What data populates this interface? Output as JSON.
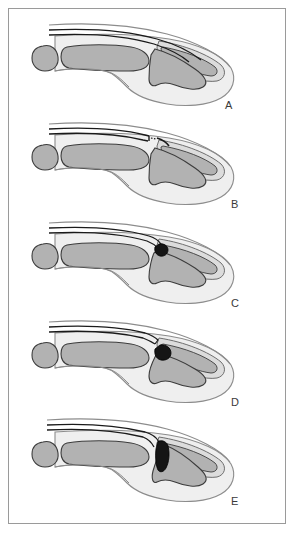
{
  "figure": {
    "panel_count": 5,
    "frame_color": "#9a9a9a",
    "background": "#ffffff"
  },
  "palette": {
    "bone_fill": "#b2b2b2",
    "bone_stroke": "#3c3c3c",
    "soft_tissue_fill": "#efefef",
    "soft_tissue_stroke": "#8c8c8c",
    "nail_fill": "#dcdcdc",
    "nail_stroke": "#6e6e6e",
    "tendon_stroke": "#1a1a1a",
    "fragment_fill": "#151515",
    "label_color": "#3a3a3a"
  },
  "panels": [
    {
      "id": "A",
      "label": "A",
      "label_x": 216,
      "label_y": 86,
      "top": 4,
      "caption": "Normal extensor tendon insertion at dorsal base of distal phalanx",
      "tendon_state": "intact",
      "fragment": "none"
    },
    {
      "id": "B",
      "label": "B",
      "label_x": 222,
      "label_y": 86,
      "top": 103,
      "caption": "Tendinous mallet — extensor tendon ruptured and retracted, no bone fragment",
      "tendon_state": "ruptured-retracted",
      "fragment": "none"
    },
    {
      "id": "C",
      "label": "C",
      "label_x": 222,
      "label_y": 86,
      "top": 202,
      "caption": "Bony mallet — small dorsal avulsion fragment, joint congruent",
      "tendon_state": "attached-to-fragment",
      "fragment": "small"
    },
    {
      "id": "D",
      "label": "D",
      "label_x": 222,
      "label_y": 86,
      "top": 301,
      "caption": "Bony mallet — displaced avulsion fragment with tendon retraction",
      "tendon_state": "attached-to-displaced-fragment",
      "fragment": "small-displaced"
    },
    {
      "id": "E",
      "label": "E",
      "label_x": 222,
      "label_y": 86,
      "top": 400,
      "caption": "Large dorsal articular fragment involving joint surface with volar subluxation",
      "tendon_state": "attached-to-large-fragment",
      "fragment": "large-articular"
    }
  ]
}
